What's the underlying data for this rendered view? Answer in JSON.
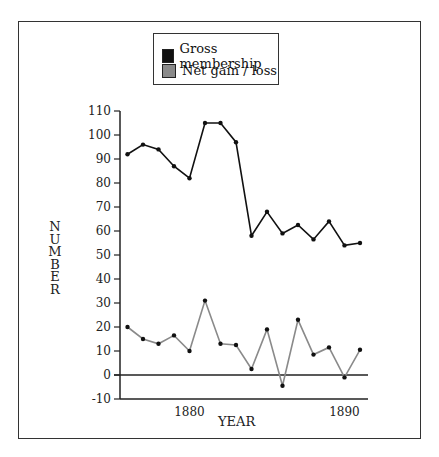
{
  "legend": {
    "items": [
      {
        "label": "Gross membership",
        "color": "#111111"
      },
      {
        "label": "Net gain / loss",
        "color": "#8a8a8a"
      }
    ]
  },
  "axes": {
    "ylabel": "NUMBER",
    "xlabel": "YEAR",
    "yticks": [
      110,
      100,
      90,
      80,
      70,
      60,
      50,
      40,
      30,
      20,
      10,
      0,
      -10
    ],
    "xticks": [
      "1880",
      "1890"
    ]
  },
  "chart_data": {
    "type": "line",
    "title": "",
    "xlabel": "YEAR",
    "ylabel": "NUMBER",
    "x": [
      1876,
      1877,
      1878,
      1879,
      1880,
      1881,
      1882,
      1883,
      1884,
      1885,
      1886,
      1887,
      1888,
      1889,
      1890,
      1891
    ],
    "series": [
      {
        "name": "Gross membership",
        "color": "#111111",
        "values": [
          92,
          96,
          94,
          87,
          82,
          105,
          105,
          97,
          58,
          68,
          59,
          62.5,
          56.5,
          64,
          54,
          55
        ]
      },
      {
        "name": "Net gain / loss",
        "color": "#8a8a8a",
        "values": [
          20,
          15,
          13,
          16.5,
          10,
          31,
          13,
          12.5,
          2.5,
          19,
          -4.5,
          23,
          8.5,
          11.5,
          -1,
          10.5
        ]
      }
    ],
    "ylim": [
      -10,
      110
    ],
    "xticks": [
      1880,
      1890
    ],
    "grid": false,
    "legend_position": "top-center",
    "zero_line": true
  }
}
